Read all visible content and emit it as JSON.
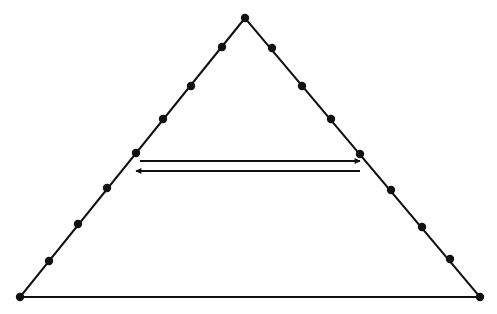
{
  "diagram": {
    "type": "triangle-with-points-and-arrows",
    "background": "#ffffff",
    "stroke_color": "#111111",
    "triangle": {
      "apex": [
        245,
        18
      ],
      "bottom_left": [
        20,
        297
      ],
      "bottom_right": [
        480,
        297
      ]
    },
    "left_points": [
      [
        245,
        18
      ],
      [
        222,
        47
      ],
      [
        191,
        86
      ],
      [
        163,
        119
      ],
      [
        136,
        153
      ],
      [
        107,
        188
      ],
      [
        78,
        224
      ],
      [
        49,
        261
      ],
      [
        20,
        297
      ]
    ],
    "right_points": [
      [
        272,
        48
      ],
      [
        302,
        86
      ],
      [
        331,
        119
      ],
      [
        360,
        154
      ],
      [
        391,
        190
      ],
      [
        422,
        227
      ],
      [
        450,
        259
      ],
      [
        480,
        297
      ]
    ],
    "arrows": [
      {
        "from": [
          140,
          161
        ],
        "to": [
          360,
          161
        ],
        "direction": "right"
      },
      {
        "from": [
          360,
          171
        ],
        "to": [
          136,
          171
        ],
        "direction": "left"
      }
    ]
  }
}
